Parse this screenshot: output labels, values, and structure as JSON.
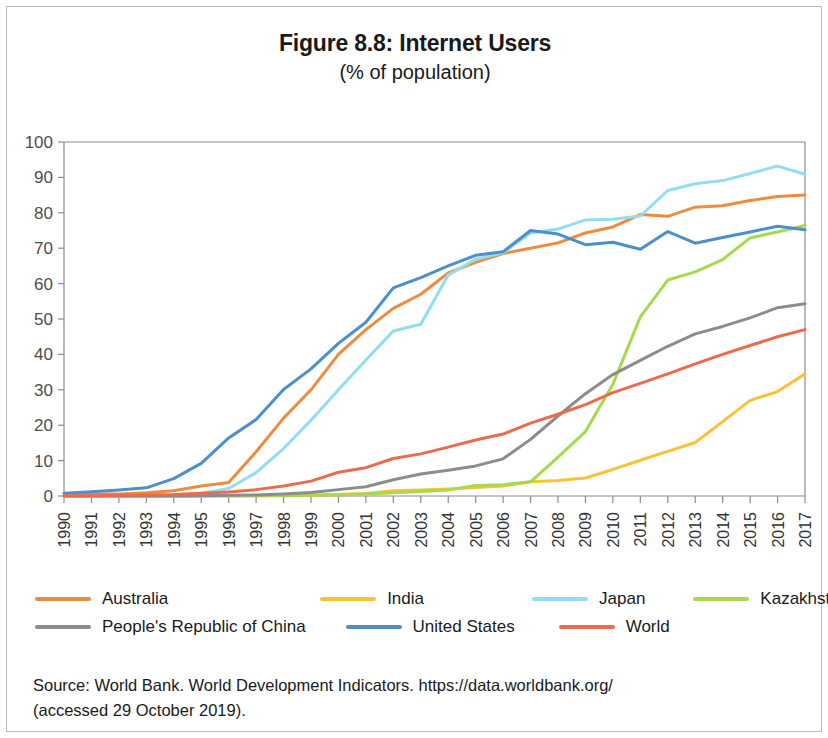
{
  "figure": {
    "title": "Figure 8.8: Internet Users",
    "subtitle": "(% of population)",
    "source_line_1": "Source: World Bank. World Development Indicators. https://data.worldbank.org/",
    "source_line_2": "(accessed 29 October 2019)."
  },
  "colors": {
    "australia": "#ED8C3F",
    "india": "#FBC235",
    "japan": "#93DDF0",
    "kazakhstan": "#A8D94C",
    "china": "#8C8C8C",
    "united_states": "#4B8FCB",
    "world": "#EC6B4C",
    "axis": "#8c8c8c",
    "frame": "#b9b9b9",
    "text": "#1a1a1a"
  },
  "chart_data": {
    "type": "line",
    "title": "Figure 8.8: Internet Users",
    "subtitle": "(% of population)",
    "xlabel": "",
    "ylabel": "",
    "ylim": [
      0,
      100
    ],
    "ytick_step": 10,
    "yticks": [
      0,
      10,
      20,
      30,
      40,
      50,
      60,
      70,
      80,
      90,
      100
    ],
    "grid": false,
    "legend_position": "bottom",
    "x": [
      1990,
      1991,
      1992,
      1993,
      1994,
      1995,
      1996,
      1997,
      1998,
      1999,
      2000,
      2001,
      2002,
      2003,
      2004,
      2005,
      2006,
      2007,
      2008,
      2009,
      2010,
      2011,
      2012,
      2013,
      2014,
      2015,
      2016,
      2017
    ],
    "categories": [
      "1990",
      "1991",
      "1992",
      "1993",
      "1994",
      "1995",
      "1996",
      "1997",
      "1998",
      "1999",
      "2000",
      "2001",
      "2002",
      "2003",
      "2004",
      "2005",
      "2006",
      "2007",
      "2008",
      "2009",
      "2010",
      "2011",
      "2012",
      "2013",
      "2014",
      "2015",
      "2016",
      "2017"
    ],
    "series": [
      {
        "name": "Australia",
        "color": "#ED8C3F",
        "values": [
          0.6,
          0.6,
          0.6,
          0.9,
          1.5,
          2.8,
          3.8,
          12.5,
          22.0,
          30.0,
          40.0,
          47.0,
          53.0,
          57.0,
          63.0,
          66.0,
          68.5,
          70.0,
          71.5,
          74.3,
          76.0,
          79.5,
          79.0,
          81.6,
          82.0,
          83.5,
          84.6,
          85.0
        ]
      },
      {
        "name": "India",
        "color": "#FBC235",
        "values": [
          0.0,
          0.0,
          0.0,
          0.0,
          0.0,
          0.03,
          0.05,
          0.07,
          0.14,
          0.27,
          0.5,
          0.7,
          1.5,
          1.7,
          2.0,
          2.4,
          2.8,
          4.0,
          4.4,
          5.1,
          7.5,
          10.1,
          12.6,
          15.1,
          21.0,
          27.0,
          29.5,
          34.5
        ]
      },
      {
        "name": "Japan",
        "color": "#93DDF0",
        "values": [
          0.02,
          0.03,
          0.05,
          0.08,
          0.15,
          0.8,
          2.1,
          6.6,
          13.4,
          21.4,
          30.0,
          38.4,
          46.6,
          48.5,
          62.4,
          66.9,
          68.7,
          74.3,
          75.4,
          78.0,
          78.2,
          79.1,
          86.3,
          88.2,
          89.1,
          91.1,
          93.2,
          90.9
        ]
      },
      {
        "name": "Kazakhstan",
        "color": "#A8D94C",
        "values": [
          0.0,
          0.0,
          0.0,
          0.0,
          0.0,
          0.0,
          0.02,
          0.05,
          0.1,
          0.2,
          0.3,
          0.6,
          0.9,
          1.3,
          1.7,
          3.0,
          3.2,
          4.0,
          11.0,
          18.2,
          31.6,
          50.6,
          61.0,
          63.3,
          66.8,
          72.9,
          74.6,
          76.4
        ]
      },
      {
        "name": "People's Republic of China",
        "color": "#8C8C8C",
        "values": [
          0.0,
          0.0,
          0.0,
          0.0,
          0.0,
          0.1,
          0.2,
          0.3,
          0.6,
          1.0,
          1.8,
          2.6,
          4.6,
          6.2,
          7.3,
          8.5,
          10.5,
          16.0,
          22.6,
          28.9,
          34.3,
          38.3,
          42.3,
          45.8,
          47.9,
          50.3,
          53.2,
          54.3
        ]
      },
      {
        "name": "United States",
        "color": "#4B8FCB",
        "values": [
          0.8,
          1.2,
          1.7,
          2.3,
          4.9,
          9.2,
          16.4,
          21.6,
          30.1,
          35.9,
          43.1,
          49.1,
          58.8,
          61.7,
          65.0,
          68.0,
          69.0,
          75.0,
          74.0,
          71.0,
          71.7,
          69.7,
          74.7,
          71.4,
          73.0,
          74.6,
          76.2,
          75.2
        ]
      },
      {
        "name": "World",
        "color": "#EC6B4C",
        "values": [
          0.05,
          0.1,
          0.2,
          0.3,
          0.4,
          0.8,
          1.1,
          1.8,
          2.8,
          4.2,
          6.7,
          8.0,
          10.6,
          11.9,
          13.8,
          15.8,
          17.5,
          20.6,
          23.1,
          25.8,
          29.2,
          31.8,
          34.5,
          37.3,
          40.0,
          42.5,
          45.0,
          47.0
        ]
      }
    ]
  },
  "legend": {
    "row1": [
      {
        "label": "Australia",
        "color": "#ED8C3F"
      },
      {
        "label": "India",
        "color": "#FBC235"
      },
      {
        "label": "Japan",
        "color": "#93DDF0"
      },
      {
        "label": "Kazakhstan",
        "color": "#A8D94C"
      }
    ],
    "row2": [
      {
        "label": "People's Republic of China",
        "color": "#8C8C8C"
      },
      {
        "label": "United States",
        "color": "#4B8FCB"
      },
      {
        "label": "World",
        "color": "#EC6B4C"
      }
    ]
  }
}
